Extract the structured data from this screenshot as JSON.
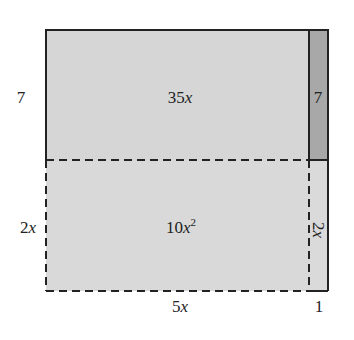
{
  "diagram": {
    "colors": {
      "light_region": "#d6d6d6",
      "dark_strip": "#a8a8a8",
      "stroke": "#222222"
    },
    "side_labels": {
      "left_top": {
        "coef": "7",
        "var": ""
      },
      "left_bottom": {
        "coef": "2",
        "var": "x"
      },
      "bottom_left": {
        "coef": "5",
        "var": "x"
      },
      "bottom_right": {
        "coef": "1",
        "var": ""
      }
    },
    "regions": {
      "top_left": {
        "coef": "35",
        "var": "x",
        "exp": ""
      },
      "top_right": {
        "coef": "7",
        "var": "",
        "exp": ""
      },
      "bottom_left": {
        "coef": "10",
        "var": "x",
        "exp": "2"
      },
      "bottom_right": {
        "coef": "2",
        "var": "x",
        "exp": "",
        "rotated": true
      }
    }
  }
}
